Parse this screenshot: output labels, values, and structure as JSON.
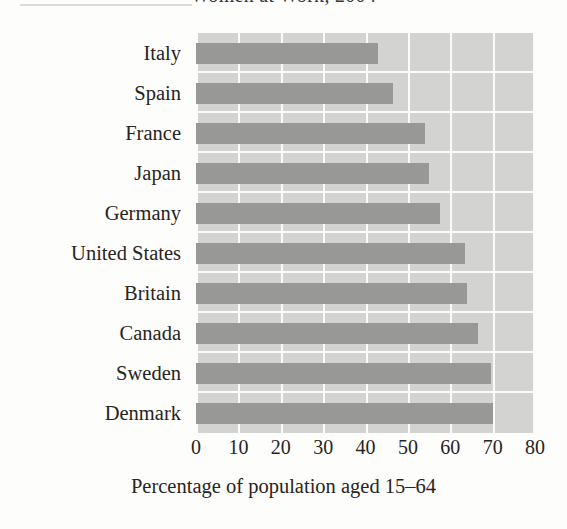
{
  "figure": {
    "title": "Women at Work, 2004",
    "title_clipped": true,
    "xaxis_title": "Percentage of population aged 15–64",
    "accent_bar_color": "#989897",
    "plot_background_color": "#d3d3d2",
    "gridline_color": "#fbfbfa",
    "page_background_color": "#fdfdfc"
  },
  "chart_data": {
    "type": "bar",
    "orientation": "horizontal",
    "title": "Women at Work, 2004",
    "xlabel": "Percentage of population aged 15–64",
    "ylabel": "",
    "xlim": [
      0,
      80
    ],
    "xticks": [
      0,
      10,
      20,
      30,
      40,
      50,
      60,
      70,
      80
    ],
    "xtick_labels": [
      "0",
      "10",
      "20",
      "30",
      "40",
      "50",
      "60",
      "70",
      "80"
    ],
    "grid": true,
    "grid_axis": "x",
    "legend": false,
    "legend_position": "none",
    "categories": [
      "Italy",
      "Spain",
      "France",
      "Japan",
      "Germany",
      "United States",
      "Britain",
      "Canada",
      "Sweden",
      "Denmark"
    ],
    "values": [
      43,
      46.5,
      54,
      55,
      57.5,
      63.5,
      64,
      66.5,
      69.5,
      70
    ],
    "series": [
      {
        "name": "Percentage of women aged 15–64 at work",
        "values": [
          43,
          46.5,
          54,
          55,
          57.5,
          63.5,
          64,
          66.5,
          69.5,
          70
        ]
      }
    ]
  },
  "xticks": [
    {
      "label": "0",
      "value": 0
    },
    {
      "label": "10",
      "value": 10
    },
    {
      "label": "20",
      "value": 20
    },
    {
      "label": "30",
      "value": 30
    },
    {
      "label": "40",
      "value": 40
    },
    {
      "label": "50",
      "value": 50
    },
    {
      "label": "60",
      "value": 60
    },
    {
      "label": "70",
      "value": 70
    },
    {
      "label": "80",
      "value": 80
    }
  ]
}
